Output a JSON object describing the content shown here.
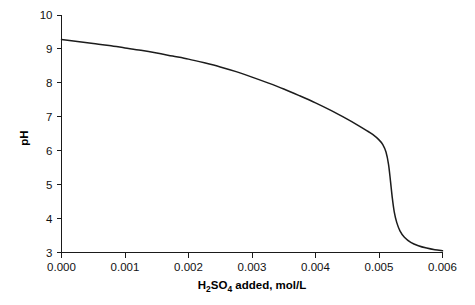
{
  "chart_data": {
    "type": "line",
    "title": "",
    "subtitle": "",
    "xlabel_parts": [
      {
        "text": "H",
        "sub": false
      },
      {
        "text": "2",
        "sub": true
      },
      {
        "text": "SO",
        "sub": false
      },
      {
        "text": "4",
        "sub": true
      },
      {
        "text": " added, mol/L",
        "sub": false
      }
    ],
    "xlabel": "H2SO4 added, mol/L",
    "ylabel": "pH",
    "xlim": [
      0.0,
      0.006
    ],
    "ylim": [
      3,
      10
    ],
    "xticks": [
      0.0,
      0.001,
      0.002,
      0.003,
      0.004,
      0.005,
      0.006
    ],
    "xtick_labels": [
      "0.000",
      "0.001",
      "0.002",
      "0.003",
      "0.004",
      "0.005",
      "0.006"
    ],
    "yticks": [
      3,
      4,
      5,
      6,
      7,
      8,
      9,
      10
    ],
    "ytick_labels": [
      "3",
      "4",
      "5",
      "6",
      "7",
      "8",
      "9",
      "10"
    ],
    "grid": false,
    "legend": "none",
    "series": [
      {
        "name": "pH titration curve",
        "color": "#1c1c1c",
        "x": [
          0.0,
          0.00025,
          0.0005,
          0.00075,
          0.001,
          0.00125,
          0.0015,
          0.00175,
          0.002,
          0.00225,
          0.0025,
          0.00275,
          0.003,
          0.00325,
          0.0035,
          0.00375,
          0.004,
          0.00425,
          0.0045,
          0.00465,
          0.0048,
          0.0049,
          0.005,
          0.00506,
          0.00511,
          0.00515,
          0.00518,
          0.00521,
          0.00524,
          0.00528,
          0.00533,
          0.0054,
          0.0055,
          0.00562,
          0.00575,
          0.00588,
          0.006
        ],
        "y": [
          9.28,
          9.22,
          9.16,
          9.1,
          9.03,
          8.96,
          8.88,
          8.79,
          8.7,
          8.59,
          8.47,
          8.33,
          8.17,
          8.0,
          7.82,
          7.62,
          7.41,
          7.18,
          6.93,
          6.77,
          6.6,
          6.48,
          6.32,
          6.18,
          5.96,
          5.6,
          5.12,
          4.6,
          4.2,
          3.88,
          3.64,
          3.45,
          3.3,
          3.2,
          3.13,
          3.08,
          3.05
        ]
      }
    ],
    "annotations": []
  }
}
